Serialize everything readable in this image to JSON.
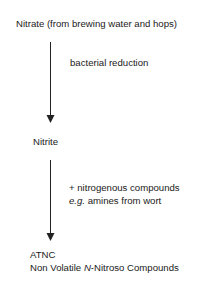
{
  "diagram": {
    "nodes": {
      "nitrate": "Nitrate (from brewing water and hops)",
      "nitrite": "Nitrite",
      "atnc": "ATNC",
      "atnc_desc_pre": "Non Volatile ",
      "atnc_desc_italic": "N",
      "atnc_desc_post": "-Nitroso Compounds"
    },
    "edges": {
      "step1_label": "bacterial reduction",
      "step2_line1": "+ nitrogenous compounds",
      "step2_line2_italic": "e.g.",
      "step2_line2_rest": " amines from wort"
    },
    "colors": {
      "text": "#1a1a1a",
      "arrow": "#222222"
    }
  }
}
